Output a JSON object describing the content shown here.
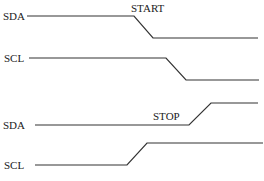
{
  "diagram": {
    "colors": {
      "line": "#333333",
      "text": "#222222",
      "background": "#ffffff"
    },
    "groups": [
      {
        "event": "START",
        "signals": [
          {
            "name": "SDA",
            "transition": "high-to-low",
            "order": 1
          },
          {
            "name": "SCL",
            "transition": "high-to-low",
            "order": 2
          }
        ]
      },
      {
        "event": "STOP",
        "signals": [
          {
            "name": "SDA",
            "transition": "low-to-high",
            "order": 2
          },
          {
            "name": "SCL",
            "transition": "low-to-high",
            "order": 1
          }
        ]
      }
    ]
  }
}
